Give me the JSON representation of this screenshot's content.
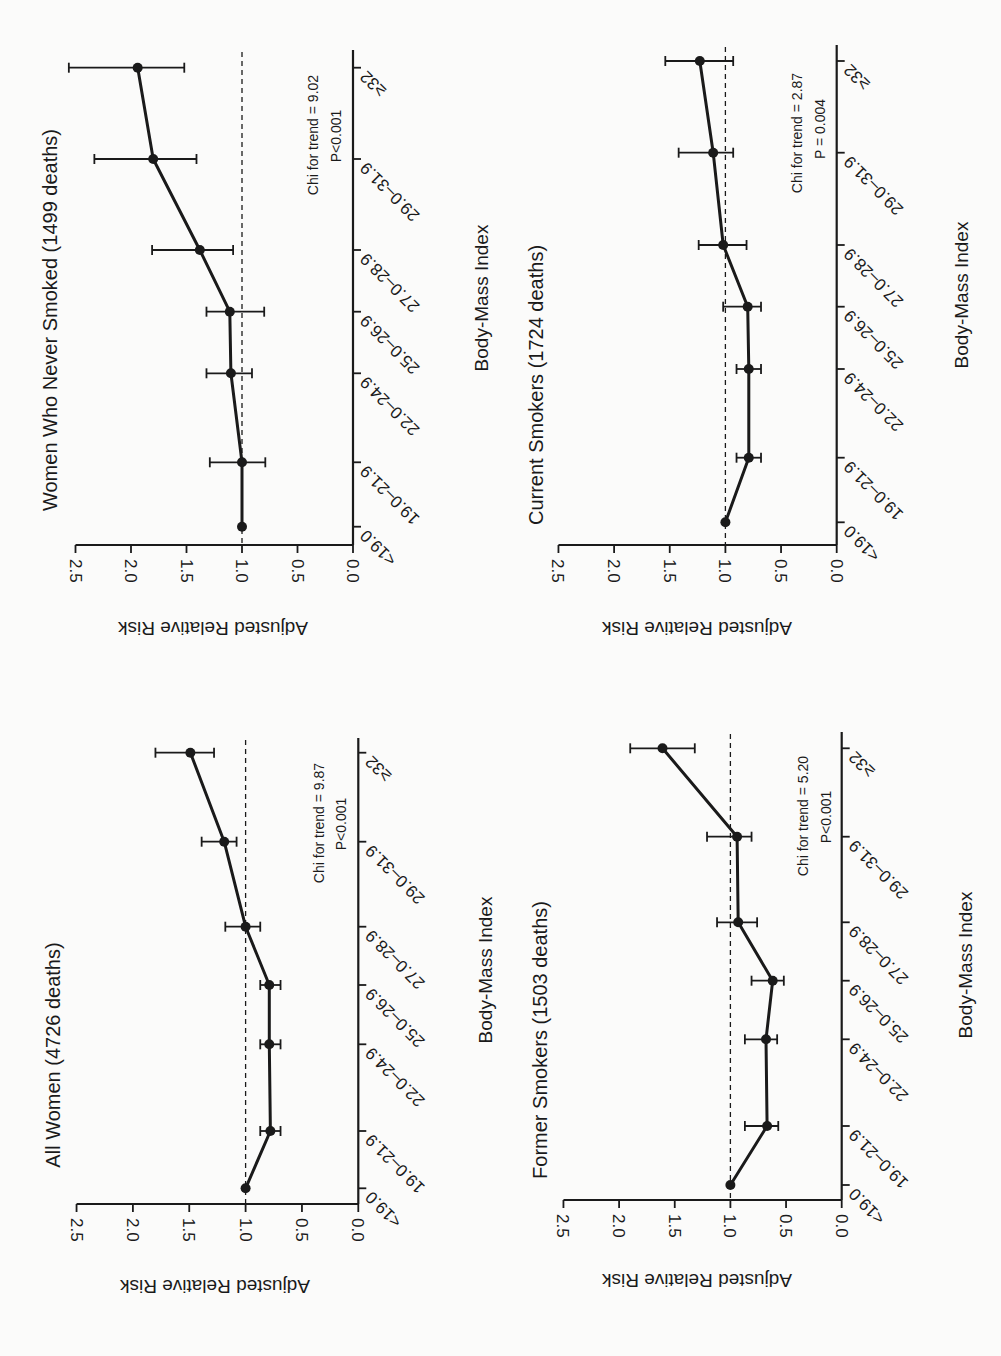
{
  "figure": {
    "orientation": "rotated 90° counter-clockwise",
    "x_axis_label": "Body-Mass Index",
    "y_axis_label": "Adjusted Relative Risk",
    "y_ticks": [
      "0.0",
      "0.5",
      "1.0",
      "1.5",
      "2.0",
      "2.5"
    ],
    "categories": [
      "<19.0",
      "19.0–21.9",
      "22.0–24.9",
      "25.0–26.9",
      "27.0–28.9",
      "29.0–31.9",
      "≥32"
    ]
  },
  "panels": [
    {
      "id": "never-smoked",
      "title": "Women Who Never Smoked (1499 deaths)",
      "chi_text": "Chi for trend = 9.02",
      "p_text": "P<0.001"
    },
    {
      "id": "all-women",
      "title": "All Women (4726 deaths)",
      "chi_text": "Chi for trend = 9.87",
      "p_text": "P<0.001"
    },
    {
      "id": "current-smokers",
      "title": "Current Smokers (1724 deaths)",
      "chi_text": "Chi for trend = 2.87",
      "p_text": "P = 0.004"
    },
    {
      "id": "former-smokers",
      "title": "Former Smokers (1503 deaths)",
      "chi_text": "Chi for trend = 5.20",
      "p_text": "P<0.001"
    }
  ],
  "chart_data": [
    {
      "type": "line",
      "title": "All Women (4726 deaths)",
      "xlabel": "Body-Mass Index",
      "ylabel": "Adjusted Relative Risk",
      "ylim": [
        0,
        2.5
      ],
      "yticks": [
        0.0,
        0.5,
        1.0,
        1.5,
        2.0,
        2.5
      ],
      "reference_line": 1.0,
      "categories": [
        "<19.0",
        "19.0–21.9",
        "22.0–24.9",
        "25.0–26.9",
        "27.0–28.9",
        "29.0–31.9",
        "≥32"
      ],
      "values": [
        1.0,
        0.78,
        0.79,
        0.79,
        1.0,
        1.19,
        1.49
      ],
      "ci_lower": [
        null,
        0.69,
        0.69,
        0.69,
        0.87,
        1.08,
        1.28
      ],
      "ci_upper": [
        null,
        0.87,
        0.87,
        0.87,
        1.18,
        1.39,
        1.8
      ],
      "annotation": [
        "Chi for trend = 9.87",
        "P<0.001"
      ]
    },
    {
      "type": "line",
      "title": "Women Who Never Smoked (1499 deaths)",
      "xlabel": "Body-Mass Index",
      "ylabel": "Adjusted Relative Risk",
      "ylim": [
        0,
        2.5
      ],
      "yticks": [
        0.0,
        0.5,
        1.0,
        1.5,
        2.0,
        2.5
      ],
      "reference_line": 1.0,
      "categories": [
        "<19.0",
        "19.0–21.9",
        "22.0–24.9",
        "25.0–26.9",
        "27.0–28.9",
        "29.0–31.9",
        "≥32"
      ],
      "values": [
        1.0,
        1.0,
        1.1,
        1.11,
        1.38,
        1.8,
        1.94
      ],
      "ci_lower": [
        null,
        0.79,
        0.91,
        0.8,
        1.08,
        1.41,
        1.52
      ],
      "ci_upper": [
        null,
        1.29,
        1.32,
        1.32,
        1.81,
        2.33,
        2.56
      ],
      "annotation": [
        "Chi for trend = 9.02",
        "P<0.001"
      ]
    },
    {
      "type": "line",
      "title": "Former Smokers (1503 deaths)",
      "xlabel": "Body-Mass Index",
      "ylabel": "Adjusted Relative Risk",
      "ylim": [
        0,
        2.5
      ],
      "yticks": [
        0.0,
        0.5,
        1.0,
        1.5,
        2.0,
        2.5
      ],
      "reference_line": 1.0,
      "categories": [
        "<19.0",
        "19.0–21.9",
        "22.0–24.9",
        "25.0–26.9",
        "27.0–28.9",
        "29.0–31.9",
        "≥32"
      ],
      "values": [
        1.0,
        0.67,
        0.68,
        0.62,
        0.93,
        0.94,
        1.61
      ],
      "ci_lower": [
        null,
        0.57,
        0.58,
        0.52,
        0.76,
        0.81,
        1.32
      ],
      "ci_upper": [
        null,
        0.87,
        0.87,
        0.81,
        1.12,
        1.21,
        1.9
      ],
      "annotation": [
        "Chi for trend = 5.20",
        "P<0.001"
      ]
    },
    {
      "type": "line",
      "title": "Current Smokers (1724 deaths)",
      "xlabel": "Body-Mass Index",
      "ylabel": "Adjusted Relative Risk",
      "ylim": [
        0,
        2.5
      ],
      "yticks": [
        0.0,
        0.5,
        1.0,
        1.5,
        2.0,
        2.5
      ],
      "reference_line": 1.0,
      "categories": [
        "<19.0",
        "19.0–21.9",
        "22.0–24.9",
        "25.0–26.9",
        "27.0–28.9",
        "29.0–31.9",
        "≥32"
      ],
      "values": [
        1.0,
        0.79,
        0.79,
        0.8,
        1.02,
        1.11,
        1.23
      ],
      "ci_lower": [
        null,
        0.68,
        0.68,
        0.68,
        0.81,
        0.93,
        0.93
      ],
      "ci_upper": [
        null,
        0.9,
        0.9,
        1.02,
        1.24,
        1.42,
        1.54
      ],
      "annotation": [
        "Chi for trend = 2.87",
        "P = 0.004"
      ]
    }
  ]
}
